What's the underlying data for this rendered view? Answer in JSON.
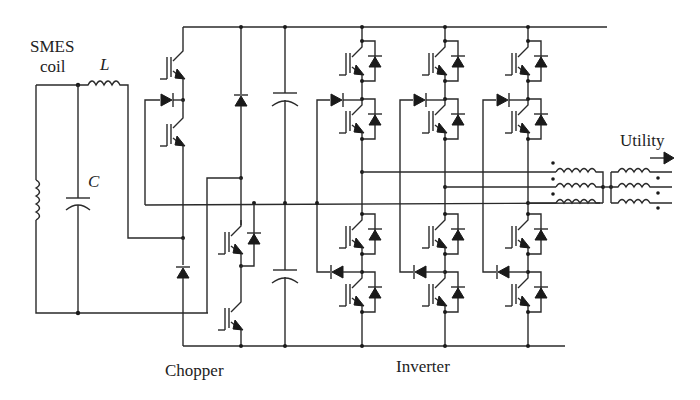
{
  "diagram": {
    "type": "circuit-schematic",
    "labels": {
      "smes_line1": "SMES",
      "smes_line2": "coil",
      "inductor": "L",
      "capacitor": "C",
      "chopper": "Chopper",
      "inverter": "Inverter",
      "utility": "Utility"
    },
    "components": {
      "smes_coil": {
        "kind": "inductor",
        "orientation": "vertical"
      },
      "filter_inductor": {
        "kind": "inductor",
        "symbol": "L"
      },
      "filter_capacitor": {
        "kind": "capacitor",
        "symbol": "C"
      },
      "chopper_switches": 4,
      "chopper_diodes": 4,
      "dc_link_capacitors": 2,
      "inverter_legs": 3,
      "inverter_switches": 12,
      "inverter_clamp_diodes": 6,
      "transformer_phases": 3
    },
    "colors": {
      "line": "#2a2a2a",
      "background": "#ffffff"
    }
  }
}
